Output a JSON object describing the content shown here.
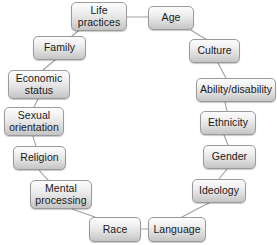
{
  "diagram": {
    "type": "cycle-ring",
    "background_color": "#ffffff",
    "node_fill_top": "#fcfcfc",
    "node_fill_bottom": "#c4c4c4",
    "node_border_color": "#9a9a9a",
    "connector_color": "#a0a0a0",
    "nodes": [
      {
        "id": "life-practices",
        "label": "Life practices",
        "x": 71,
        "y": 2,
        "w": 56,
        "h": 29
      },
      {
        "id": "age",
        "label": "Age",
        "x": 148,
        "y": 6,
        "w": 46,
        "h": 24
      },
      {
        "id": "culture",
        "label": "Culture",
        "x": 189,
        "y": 39,
        "w": 51,
        "h": 24
      },
      {
        "id": "ability-disability",
        "label": "Ability/disability",
        "x": 196,
        "y": 78,
        "w": 80,
        "h": 24
      },
      {
        "id": "ethnicity",
        "label": "Ethnicity",
        "x": 200,
        "y": 111,
        "w": 56,
        "h": 24
      },
      {
        "id": "gender",
        "label": "Gender",
        "x": 203,
        "y": 145,
        "w": 53,
        "h": 24
      },
      {
        "id": "ideology",
        "label": "Ideology",
        "x": 192,
        "y": 179,
        "w": 54,
        "h": 24
      },
      {
        "id": "language",
        "label": "Language",
        "x": 148,
        "y": 217,
        "w": 58,
        "h": 25
      },
      {
        "id": "race",
        "label": "Race",
        "x": 89,
        "y": 217,
        "w": 52,
        "h": 25
      },
      {
        "id": "mental-processing",
        "label": "Mental processing",
        "x": 30,
        "y": 180,
        "w": 62,
        "h": 29
      },
      {
        "id": "religion",
        "label": "Religion",
        "x": 13,
        "y": 146,
        "w": 53,
        "h": 24
      },
      {
        "id": "sexual-orientation",
        "label": "Sexual orientation",
        "x": 4,
        "y": 107,
        "w": 60,
        "h": 29
      },
      {
        "id": "economic-status",
        "label": "Economic status",
        "x": 8,
        "y": 70,
        "w": 62,
        "h": 29
      },
      {
        "id": "family",
        "label": "Family",
        "x": 33,
        "y": 36,
        "w": 53,
        "h": 24
      }
    ],
    "links": [
      {
        "from": "life-practices",
        "to": "age",
        "d": "M 127 17 L 148 17"
      },
      {
        "from": "age",
        "to": "culture",
        "d": "M 191 30 Q 200 36 206 39"
      },
      {
        "from": "culture",
        "to": "ability-disability",
        "d": "M 218 63 Q 222 71 226 78"
      },
      {
        "from": "ability-disability",
        "to": "ethnicity",
        "d": "M 225 102 Q 226 107 227 111"
      },
      {
        "from": "ethnicity",
        "to": "gender",
        "d": "M 224 135 Q 226 140 228 145"
      },
      {
        "from": "gender",
        "to": "ideology",
        "d": "M 227 169 Q 223 174 219 179"
      },
      {
        "from": "ideology",
        "to": "language",
        "d": "M 209 203 Q 193 211 182 217"
      },
      {
        "from": "language",
        "to": "race",
        "d": "M 148 229 L 141 229"
      },
      {
        "from": "race",
        "to": "mental-processing",
        "d": "M 95 217 Q 83 213 72 209"
      },
      {
        "from": "mental-processing",
        "to": "religion",
        "d": "M 48 180 Q 43 175 39 170"
      },
      {
        "from": "religion",
        "to": "sexual-orientation",
        "d": "M 36 146 Q 34 141 33 136"
      },
      {
        "from": "sexual-orientation",
        "to": "economic-status",
        "d": "M 34 107 Q 36 103 38 99"
      },
      {
        "from": "economic-status",
        "to": "family",
        "d": "M 43 70 Q 49 65 55 60"
      },
      {
        "from": "family",
        "to": "life-practices",
        "d": "M 72 36 Q 82 28 91 21"
      }
    ]
  }
}
